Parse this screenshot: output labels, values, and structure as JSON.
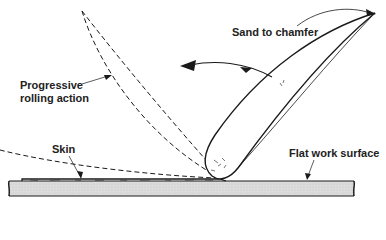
{
  "diagram": {
    "labels": {
      "sand_to_chamfer": "Sand to chamfer",
      "progressive_line1": "Progressive",
      "progressive_line2": "rolling action",
      "skin": "Skin",
      "flat_work_surface": "Flat work surface"
    },
    "colors": {
      "line": "#1a1a1a",
      "surface_fill": "#d9d9d9",
      "background": "#ffffff"
    }
  }
}
